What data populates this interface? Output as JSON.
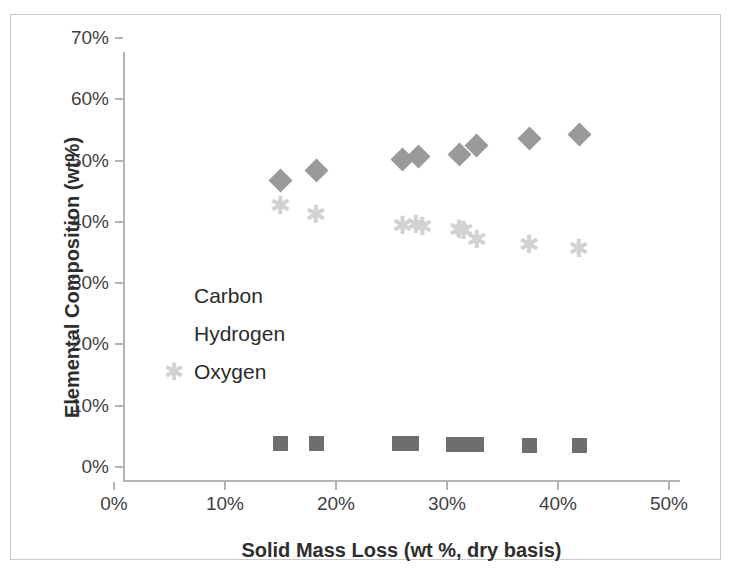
{
  "chart_data": {
    "type": "scatter",
    "title": "",
    "xlabel": "Solid Mass Loss (wt %, dry basis)",
    "ylabel": "Elemental Composition (wt%)",
    "xlim": [
      0,
      50
    ],
    "ylim": [
      0,
      70
    ],
    "xticks": [
      "0%",
      "10%",
      "20%",
      "30%",
      "40%",
      "50%"
    ],
    "xtick_values": [
      0,
      10,
      20,
      30,
      40,
      50
    ],
    "yticks": [
      "0%",
      "10%",
      "20%",
      "30%",
      "40%",
      "50%",
      "60%",
      "70%"
    ],
    "ytick_values": [
      0,
      10,
      20,
      30,
      40,
      50,
      60,
      70
    ],
    "grid": false,
    "legend_position": "inside-left",
    "series": [
      {
        "name": "Carbon",
        "marker": "diamond",
        "color": "#9a9a9a",
        "points": [
          {
            "x": 14.1,
            "y": 49.1
          },
          {
            "x": 17.3,
            "y": 50.7
          },
          {
            "x": 25.1,
            "y": 52.5
          },
          {
            "x": 26.5,
            "y": 52.9
          },
          {
            "x": 30.2,
            "y": 53.3
          },
          {
            "x": 31.8,
            "y": 54.7
          },
          {
            "x": 36.5,
            "y": 55.9
          },
          {
            "x": 41.0,
            "y": 56.5
          }
        ]
      },
      {
        "name": "Hydrogen",
        "marker": "square",
        "color": "#6e6e6e",
        "points": [
          {
            "x": 14.1,
            "y": 6.1
          },
          {
            "x": 17.3,
            "y": 6.1
          },
          {
            "x": 24.8,
            "y": 6.1
          },
          {
            "x": 25.9,
            "y": 6.1
          },
          {
            "x": 29.7,
            "y": 6.0
          },
          {
            "x": 30.4,
            "y": 5.9
          },
          {
            "x": 31.8,
            "y": 5.9
          },
          {
            "x": 36.5,
            "y": 5.8
          },
          {
            "x": 41.0,
            "y": 5.8
          }
        ]
      },
      {
        "name": "Oxygen",
        "marker": "asterisk",
        "color": "#d2d2d2",
        "points": [
          {
            "x": 14.1,
            "y": 44.8
          },
          {
            "x": 17.3,
            "y": 43.4
          },
          {
            "x": 25.1,
            "y": 41.6
          },
          {
            "x": 26.3,
            "y": 41.8
          },
          {
            "x": 26.9,
            "y": 41.4
          },
          {
            "x": 30.2,
            "y": 41.0
          },
          {
            "x": 30.6,
            "y": 40.8
          },
          {
            "x": 31.8,
            "y": 39.4
          },
          {
            "x": 36.5,
            "y": 38.5
          },
          {
            "x": 41.0,
            "y": 37.9
          }
        ]
      }
    ]
  },
  "legend": {
    "items": [
      {
        "label": "Carbon",
        "icon": "diamond-marker-icon"
      },
      {
        "label": "Hydrogen",
        "icon": "square-marker-icon"
      },
      {
        "label": "Oxygen",
        "icon": "asterisk-marker-icon"
      }
    ]
  },
  "colors": {
    "carbon": "#9a9a9a",
    "hydrogen": "#6e6e6e",
    "oxygen": "#d2d2d2",
    "axis": "#b3b3b3",
    "text": "#3f3f3f",
    "frame": "#c9c9c9"
  }
}
